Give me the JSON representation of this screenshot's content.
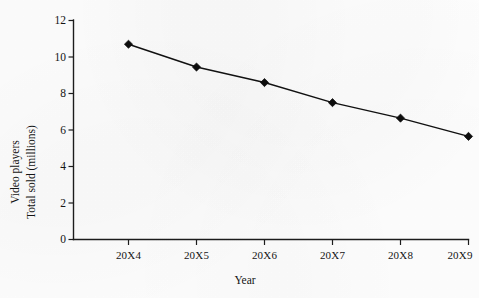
{
  "chart_data": {
    "type": "line",
    "title": "",
    "xlabel": "Year",
    "ylabel_lines": [
      "Video players",
      "Total sold (millions)"
    ],
    "ylabel": "Video players Total sold (millions)",
    "categories": [
      "20X4",
      "20X5",
      "20X6",
      "20X7",
      "20X8",
      "20X9"
    ],
    "values": [
      10.7,
      9.45,
      8.6,
      7.5,
      6.65,
      5.65
    ],
    "series": [
      {
        "name": "Total sold (millions)",
        "values": [
          10.7,
          9.45,
          8.6,
          7.5,
          6.65,
          5.65
        ]
      }
    ],
    "ylim": [
      0,
      12
    ],
    "yticks": [
      0,
      2,
      4,
      6,
      8,
      10,
      12
    ],
    "ytick_labels": [
      "0",
      "2",
      "4",
      "6",
      "8",
      "10",
      "12"
    ],
    "xtick_labels": [
      "20X4",
      "20X5",
      "20X6",
      "20X7",
      "20X8",
      "20X9"
    ],
    "grid": false,
    "legend": false,
    "legend_position": "none",
    "marker": "diamond",
    "line_color": "#111111",
    "marker_color": "#0d0d0d",
    "axis_color": "#1c1c1c",
    "background_color": "#fefefe"
  }
}
